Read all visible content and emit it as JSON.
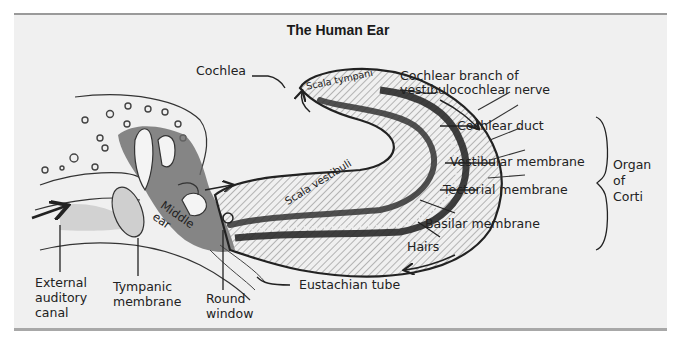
{
  "title": "The Human Ear",
  "labels": {
    "cochlea": "Cochlea",
    "scala_tympani": "Scala tympani",
    "scala_vestibuli": "Scala vestibuli",
    "cochlear_branch": "Cochlear branch of\nvestibulocochlear nerve",
    "cochlear_duct": "Cochlear duct",
    "vestibular_membrane": "Vestibular membrane",
    "tectorial_membrane": "Tectorial membrane",
    "basilar_membrane": "Basilar membrane",
    "hairs": "Hairs",
    "organ_of_corti": "Organ\nof\nCorti",
    "middle_ear": "Middle\near",
    "external_auditory_canal": "External\nauditory\ncanal",
    "tympanic_membrane": "Tympanic\nmembrane",
    "round_window": "Round\nwindow",
    "eustachian_tube": "Eustachian tube"
  },
  "colors": {
    "panel_bg": "#f0f0f0",
    "ink": "#222222",
    "border": "#9a9a9a"
  }
}
